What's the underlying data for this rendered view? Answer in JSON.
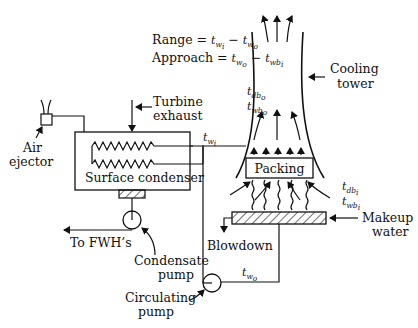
{
  "equations": {
    "range": {
      "lhs": "Range",
      "rhs_a": "t",
      "rhs_a_sub": "w",
      "rhs_a_subsub": "i",
      "rhs_b": "t",
      "rhs_b_sub": "w",
      "rhs_b_subsub": "o"
    },
    "approach": {
      "lhs": "Approach",
      "rhs_a": "t",
      "rhs_a_sub": "w",
      "rhs_a_subsub": "o",
      "rhs_b": "t",
      "rhs_b_sub": "wb",
      "rhs_b_subsub": "i"
    }
  },
  "labels": {
    "cooling_tower": [
      "Cooling",
      "tower"
    ],
    "turbine_exhaust": [
      "Turbine",
      "exhaust"
    ],
    "air_ejector": [
      "Air",
      "ejector"
    ],
    "surface_condenser": "Surface condenser",
    "packing": "Packing",
    "makeup_water": [
      "Makeup",
      "water"
    ],
    "blowdown": "Blowdown",
    "to_fwh": "To FWH’s",
    "condensate_pump": [
      "Condensate",
      "pump"
    ],
    "circulating_pump": [
      "Circulating",
      "pump"
    ]
  },
  "variables": {
    "t_db_o": {
      "t": "t",
      "sub": "db",
      "subsub": "o"
    },
    "t_wb_o": {
      "t": "t",
      "sub": "wb",
      "subsub": "o"
    },
    "t_w_i": {
      "t": "t",
      "sub": "w",
      "subsub": "i"
    },
    "t_db_i": {
      "t": "t",
      "sub": "db",
      "subsub": "i"
    },
    "t_wb_i": {
      "t": "t",
      "sub": "wb",
      "subsub": "i"
    },
    "t_w_o": {
      "t": "t",
      "sub": "w",
      "subsub": "o"
    }
  }
}
